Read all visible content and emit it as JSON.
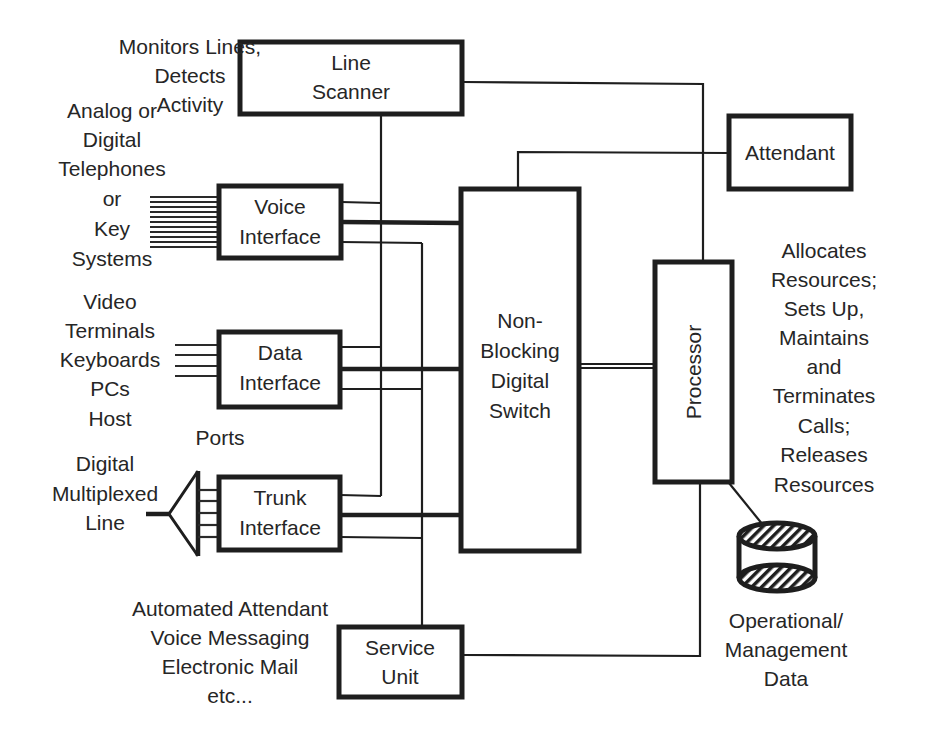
{
  "diagram": {
    "type": "block-diagram",
    "blocks": {
      "line_scanner": {
        "lines": [
          "Line",
          "Scanner"
        ]
      },
      "voice_interface": {
        "lines": [
          "Voice",
          "Interface"
        ]
      },
      "data_interface": {
        "lines": [
          "Data",
          "Interface"
        ]
      },
      "trunk_interface": {
        "lines": [
          "Trunk",
          "Interface"
        ]
      },
      "switch": {
        "lines": [
          "Non-",
          "Blocking",
          "Digital",
          "Switch"
        ]
      },
      "processor": {
        "label": "Processor"
      },
      "attendant": {
        "label": "Attendant"
      },
      "service_unit": {
        "lines": [
          "Service",
          "Unit"
        ]
      },
      "database": {
        "lines": [
          "Operational/",
          "Management",
          "Data"
        ]
      }
    },
    "annotations": {
      "scanner_note": [
        "Monitors Lines,",
        "Detects",
        "Activity"
      ],
      "voice_note": [
        "Analog or",
        "Digital",
        "Telephones",
        "or",
        "Key",
        "Systems"
      ],
      "data_note": [
        "Video",
        "Terminals",
        "Keyboards",
        "PCs",
        "Host"
      ],
      "ports_note": "Ports",
      "trunk_note": [
        "Digital",
        "Multiplexed",
        "Line"
      ],
      "service_note": [
        "Automated Attendant",
        "Voice Messaging",
        "Electronic Mail",
        "etc..."
      ],
      "processor_note": [
        "Allocates",
        "Resources;",
        "Sets Up,",
        "Maintains",
        "and",
        "Terminates",
        "Calls;",
        "Releases",
        "Resources"
      ]
    },
    "connections": [
      {
        "from": "line_scanner",
        "to": "processor"
      },
      {
        "from": "line_scanner",
        "to": "voice_interface"
      },
      {
        "from": "line_scanner",
        "to": "data_interface"
      },
      {
        "from": "line_scanner",
        "to": "trunk_interface"
      },
      {
        "from": "voice_interface",
        "to": "switch",
        "style": "thick"
      },
      {
        "from": "data_interface",
        "to": "switch",
        "style": "thick"
      },
      {
        "from": "trunk_interface",
        "to": "switch",
        "style": "thick"
      },
      {
        "from": "service_unit",
        "to": "voice_interface"
      },
      {
        "from": "service_unit",
        "to": "data_interface"
      },
      {
        "from": "service_unit",
        "to": "trunk_interface"
      },
      {
        "from": "switch",
        "to": "attendant"
      },
      {
        "from": "switch",
        "to": "processor",
        "style": "double"
      },
      {
        "from": "service_unit",
        "to": "processor"
      },
      {
        "from": "processor",
        "to": "database"
      }
    ]
  }
}
